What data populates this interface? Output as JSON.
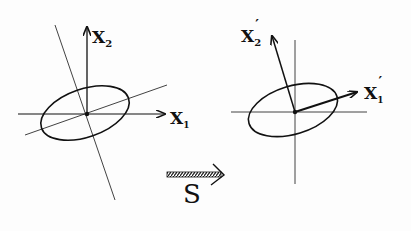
{
  "left_panel": {
    "axis_x1_label": "X",
    "axis_x1_sub": "1",
    "axis_x2_label": "X",
    "axis_x2_sub": "2"
  },
  "right_panel": {
    "axis_x1_label": "X",
    "axis_x1_sub": "1",
    "axis_x1_prime": "′",
    "axis_x2_label": "X",
    "axis_x2_sub": "2",
    "axis_x2_prime": "′"
  },
  "transform": {
    "label": "S",
    "arrow_icon": "hatched-arrow-right"
  },
  "colors": {
    "ink": "#111111",
    "background": "#fdfdfd"
  }
}
